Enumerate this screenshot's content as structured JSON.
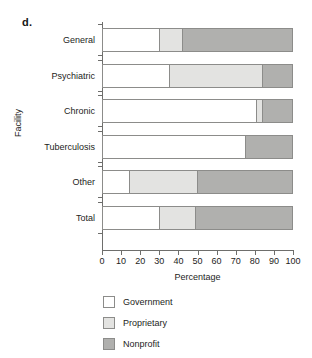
{
  "panel_label": "d.",
  "chart_data": {
    "type": "bar",
    "orientation": "horizontal",
    "stacked": true,
    "title": "",
    "xlabel": "Percentage",
    "ylabel": "Facility",
    "xlim": [
      0,
      100
    ],
    "xticks": [
      0,
      10,
      20,
      30,
      40,
      50,
      60,
      70,
      80,
      90,
      100
    ],
    "grid": false,
    "legend_position": "below",
    "categories": [
      "General",
      "Psychiatric",
      "Chronic",
      "Tuberculosis",
      "Other",
      "Total"
    ],
    "series": [
      {
        "name": "Government",
        "color": "#ffffff",
        "values": [
          30,
          35,
          81,
          75,
          14,
          30
        ]
      },
      {
        "name": "Proprietary",
        "color": "#e3e3e1",
        "values": [
          12,
          49,
          3,
          0,
          36,
          19
        ]
      },
      {
        "name": "Nonprofit",
        "color": "#b0b0ae",
        "values": [
          58,
          16,
          16,
          25,
          50,
          51
        ]
      }
    ]
  }
}
